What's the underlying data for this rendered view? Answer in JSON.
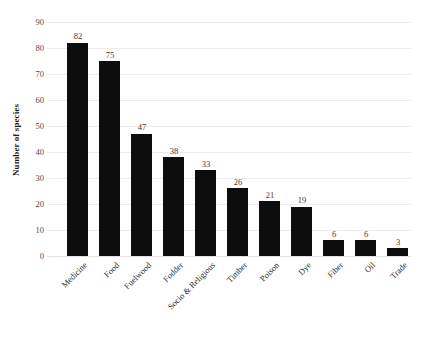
{
  "chart_data": {
    "type": "bar",
    "title": "",
    "xlabel": "",
    "ylabel": "Number of species",
    "categories": [
      "Medicine",
      "Food",
      "Fuelwood",
      "Fodder",
      "Socio & Religious",
      "Timber",
      "Poison",
      "Dye",
      "Fiber",
      "Oil",
      "Trade"
    ],
    "values": [
      82,
      75,
      47,
      38,
      33,
      26,
      21,
      19,
      6,
      6,
      3
    ],
    "value_labels": [
      "82",
      "75",
      "47",
      "38",
      "33",
      "26",
      "21",
      "19",
      "6",
      "6",
      "3"
    ],
    "ylim": [
      0,
      90
    ],
    "yticks": [
      0,
      10,
      20,
      30,
      40,
      50,
      60,
      70,
      80,
      90
    ],
    "ytick_labels": [
      "0",
      "10",
      "20",
      "30",
      "40",
      "50",
      "60",
      "70",
      "80",
      "90"
    ],
    "grid": true,
    "grid_axis": "y",
    "legend": false,
    "legend_position": "none",
    "bar_color": "#0d0d0d",
    "grid_color": "#ededed",
    "background_color": "#ffffff",
    "data_label_color": "#3d3d3d",
    "tick_label_color": "#4d4d4d"
  }
}
